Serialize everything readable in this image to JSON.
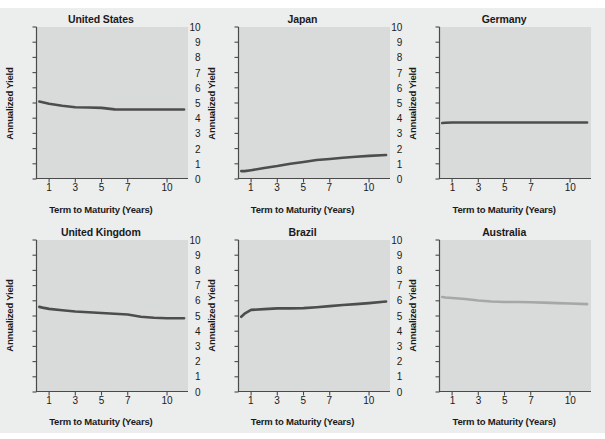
{
  "figure": {
    "background_color": "#eceded",
    "panel_background_color": "#d9dada",
    "axis_color": "#4a4a4a",
    "line_color_dark": "#4d4d4d",
    "line_color_light": "#a6a8a8"
  },
  "axis": {
    "ylabel": "Annualized Yield",
    "xlabel": "Term to Maturity (Years)",
    "yticks": [
      0,
      1,
      2,
      3,
      4,
      5,
      6,
      7,
      8,
      9,
      10
    ],
    "ytick_labels": [
      "0",
      "1",
      "2",
      "3",
      "4",
      "5",
      "6",
      "7",
      "8",
      "9",
      "10"
    ],
    "xticks": [
      1,
      3,
      5,
      7,
      10
    ],
    "xtick_labels": [
      "1",
      "3",
      "5",
      "7",
      "10"
    ],
    "ylim": [
      0,
      10
    ],
    "xlim": [
      0,
      11.6
    ]
  },
  "chart_data": [
    {
      "type": "line",
      "title": "United States",
      "xlabel": "Term to Maturity (Years)",
      "ylabel": "Annualized Yield",
      "ylim": [
        0,
        10
      ],
      "xlim": [
        0,
        11.6
      ],
      "grid": false,
      "legend": "none",
      "color": "#4d4d4d",
      "x": [
        0.25,
        0.5,
        1,
        2,
        3,
        4,
        5,
        6,
        7,
        8,
        9,
        10,
        11.3
      ],
      "y": [
        5.1,
        5.05,
        4.95,
        4.82,
        4.72,
        4.7,
        4.68,
        4.58,
        4.57,
        4.57,
        4.57,
        4.57,
        4.57
      ]
    },
    {
      "type": "line",
      "title": "Japan",
      "xlabel": "Term to Maturity (Years)",
      "ylabel": "Annualized Yield",
      "ylim": [
        0,
        10
      ],
      "xlim": [
        0,
        11.6
      ],
      "grid": false,
      "legend": "none",
      "color": "#4d4d4d",
      "x": [
        0.25,
        0.5,
        1,
        2,
        3,
        4,
        5,
        6,
        7,
        8,
        9,
        10,
        11.3
      ],
      "y": [
        0.52,
        0.52,
        0.58,
        0.72,
        0.85,
        1.0,
        1.12,
        1.25,
        1.32,
        1.4,
        1.46,
        1.52,
        1.58
      ]
    },
    {
      "type": "line",
      "title": "Germany",
      "xlabel": "Term to Maturity (Years)",
      "ylabel": "Annualized Yield",
      "ylim": [
        0,
        10
      ],
      "xlim": [
        0,
        11.6
      ],
      "grid": false,
      "legend": "none",
      "color": "#4d4d4d",
      "x": [
        0.25,
        0.5,
        1,
        2,
        3,
        4,
        5,
        6,
        7,
        8,
        9,
        10,
        11.3
      ],
      "y": [
        3.68,
        3.7,
        3.72,
        3.72,
        3.72,
        3.72,
        3.72,
        3.72,
        3.72,
        3.72,
        3.72,
        3.72,
        3.72
      ]
    },
    {
      "type": "line",
      "title": "United Kingdom",
      "xlabel": "Term to Maturity (Years)",
      "ylabel": "Annualized Yield",
      "ylim": [
        0,
        10
      ],
      "xlim": [
        0,
        11.6
      ],
      "grid": false,
      "legend": "none",
      "color": "#4d4d4d",
      "x": [
        0.25,
        0.5,
        1,
        2,
        3,
        4,
        5,
        6,
        7,
        8,
        9,
        10,
        11.3
      ],
      "y": [
        5.6,
        5.55,
        5.47,
        5.38,
        5.3,
        5.25,
        5.2,
        5.15,
        5.1,
        4.95,
        4.88,
        4.85,
        4.85
      ]
    },
    {
      "type": "line",
      "title": "Brazil",
      "xlabel": "Term to Maturity (Years)",
      "ylabel": "Annualized Yield",
      "ylim": [
        0,
        10
      ],
      "xlim": [
        0,
        11.6
      ],
      "grid": false,
      "legend": "none",
      "color": "#4d4d4d",
      "x": [
        0.25,
        0.5,
        1,
        2,
        3,
        4,
        5,
        6,
        7,
        8,
        9,
        10,
        11.3
      ],
      "y": [
        4.95,
        5.15,
        5.4,
        5.45,
        5.5,
        5.5,
        5.52,
        5.58,
        5.65,
        5.72,
        5.78,
        5.85,
        5.95
      ]
    },
    {
      "type": "line",
      "title": "Australia",
      "xlabel": "Term to Maturity (Years)",
      "ylabel": "Annualized Yield",
      "ylim": [
        0,
        10
      ],
      "xlim": [
        0,
        11.6
      ],
      "grid": false,
      "legend": "none",
      "color": "#a6a8a8",
      "x": [
        0.25,
        0.5,
        1,
        2,
        3,
        4,
        5,
        6,
        7,
        8,
        9,
        10,
        11.3
      ],
      "y": [
        6.25,
        6.22,
        6.18,
        6.12,
        6.02,
        5.95,
        5.92,
        5.92,
        5.9,
        5.88,
        5.85,
        5.82,
        5.78
      ]
    }
  ]
}
